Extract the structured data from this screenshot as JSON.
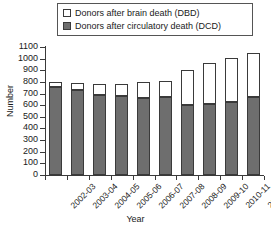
{
  "chart_data": {
    "type": "bar",
    "stacked": true,
    "title": "",
    "xlabel": "Year",
    "ylabel": "Number",
    "ylim": [
      0,
      1100
    ],
    "ytick_step": 100,
    "yticks": [
      0,
      100,
      200,
      300,
      400,
      500,
      600,
      700,
      800,
      900,
      1000,
      1100
    ],
    "grid": false,
    "legend_position": "top",
    "categories": [
      "2002-03",
      "2003-04",
      "2004-05",
      "2005-06",
      "2006-07",
      "2007-08",
      "2008-09",
      "2009-10",
      "2010-11",
      "2011-12"
    ],
    "series": [
      {
        "name": "Donors after circulatory death (DCD)",
        "key": "dcd",
        "color": "#6e6e6e",
        "values": [
          760,
          730,
          690,
          680,
          660,
          670,
          600,
          610,
          630,
          670
        ]
      },
      {
        "name": "Donors after brain death (DBD)",
        "key": "dbd",
        "color": "#ffffff",
        "values": [
          40,
          60,
          90,
          100,
          140,
          140,
          300,
          350,
          380,
          380
        ]
      }
    ],
    "totals": [
      800,
      790,
      780,
      780,
      800,
      810,
      900,
      960,
      1010,
      1050
    ]
  },
  "legend": {
    "items": [
      {
        "label": "Donors after brain death (DBD)",
        "swatch": "dbd"
      },
      {
        "label": "Donors after circulatory death (DCD)",
        "swatch": "dcd"
      }
    ]
  },
  "axes": {
    "y_title": "Number",
    "x_title": "Year"
  },
  "colors": {
    "dcd_fill": "#6e6e6e",
    "dbd_fill": "#ffffff",
    "outline": "#3a3a3a",
    "background": "#ffffff"
  }
}
